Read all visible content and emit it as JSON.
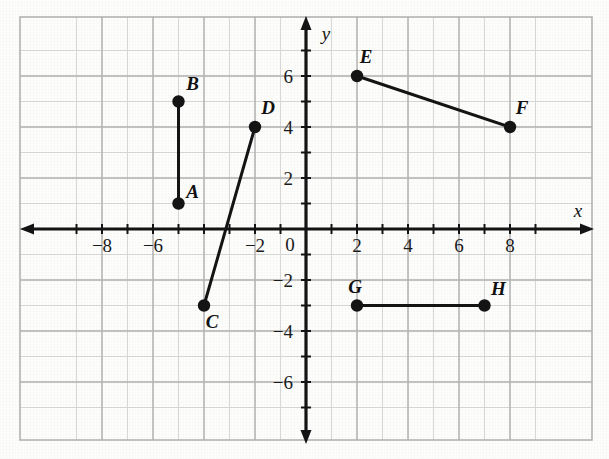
{
  "chart_data": {
    "type": "scatter",
    "title": "",
    "xlabel": "x",
    "ylabel": "y",
    "xlim": [
      -9,
      9
    ],
    "ylim": [
      -7,
      7
    ],
    "grid": true,
    "grid_minor_step": 1,
    "grid_major_step": 2,
    "legend": "none",
    "x_tick_labels": [
      "-8",
      "-6",
      "-2",
      "0",
      "2",
      "4",
      "6",
      "8"
    ],
    "x_tick_values": [
      -8,
      -6,
      -2,
      0,
      2,
      4,
      6,
      8
    ],
    "y_tick_labels": [
      "6",
      "4",
      "2",
      "0",
      "-2",
      "-4",
      "-6"
    ],
    "y_tick_values": [
      6,
      4,
      2,
      0,
      -2,
      -4,
      -6
    ],
    "points": [
      {
        "label": "A",
        "x": -5,
        "y": 1
      },
      {
        "label": "B",
        "x": -5,
        "y": 5
      },
      {
        "label": "C",
        "x": -4,
        "y": -3
      },
      {
        "label": "D",
        "x": -2,
        "y": 4
      },
      {
        "label": "E",
        "x": 2,
        "y": 6
      },
      {
        "label": "F",
        "x": 8,
        "y": 4
      },
      {
        "label": "G",
        "x": 2,
        "y": -3
      },
      {
        "label": "H",
        "x": 7,
        "y": -3
      }
    ],
    "segments": [
      {
        "name": "AB",
        "from": "A",
        "to": "B"
      },
      {
        "name": "CD",
        "from": "C",
        "to": "D"
      },
      {
        "name": "EF",
        "from": "E",
        "to": "F"
      },
      {
        "name": "GH",
        "from": "G",
        "to": "H"
      }
    ],
    "colors": {
      "ink": "#141414",
      "grid_minor": "#d8d8d8",
      "grid_major": "#b4b4b4",
      "background": "#fdfdfc"
    }
  },
  "axes": {
    "x_axis_name": "x",
    "y_axis_name": "y",
    "origin_label": "0"
  },
  "point_labels": {
    "A": "A",
    "B": "B",
    "C": "C",
    "D": "D",
    "E": "E",
    "F": "F",
    "G": "G",
    "H": "H"
  }
}
